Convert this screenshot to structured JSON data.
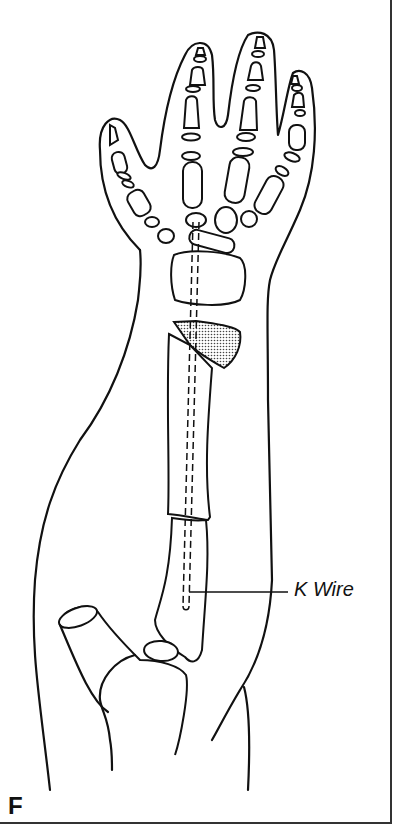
{
  "figure": {
    "panel_letter": "F",
    "annotations": [
      {
        "label": "K Wire",
        "target": "kirschner-wire"
      }
    ],
    "colors": {
      "line": "#111111",
      "background": "#ffffff",
      "shaded_fragment": "#bbbbbb"
    }
  }
}
